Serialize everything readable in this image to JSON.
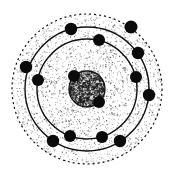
{
  "figure": {
    "caption": "",
    "style": "vintage engraving / stippled line art",
    "colors": {
      "background": "#ffffff",
      "ink": "#111111",
      "stipple": "#2a2a2a",
      "nucleus_fill": "#888888"
    },
    "canvas": {
      "width": 175,
      "height": 178
    },
    "center": {
      "x": 87,
      "y": 89
    }
  },
  "nucleus": {
    "label": "nucleus",
    "cx": 87,
    "cy": 89,
    "r": 18,
    "texture": "dense-stipple",
    "outline": true,
    "blobs": [
      {
        "name": "nucleon-blob-upper-left",
        "cx": 74,
        "cy": 76,
        "r": 6
      },
      {
        "name": "nucleon-blob-lower-right",
        "cx": 99,
        "cy": 102,
        "r": 6
      }
    ]
  },
  "shells": [
    {
      "name": "inner-shell",
      "index": 1,
      "r": 50,
      "stroke": "solid",
      "stroke_width": 1.4,
      "electron_count": 5
    },
    {
      "name": "middle-shell",
      "index": 2,
      "r": 62,
      "stroke": "solid",
      "stroke_width": 1.4,
      "electron_count": 6
    },
    {
      "name": "outer-shell",
      "index": 3,
      "r": 75,
      "stroke": "dashed",
      "stroke_width": 1.2,
      "dash": "2 3",
      "electron_count": 1
    }
  ],
  "electrons": [
    {
      "id": 1,
      "shell": 1,
      "angle_deg": -76,
      "cx": 99,
      "cy": 40,
      "r": 6.0
    },
    {
      "id": 2,
      "shell": 1,
      "angle_deg": -14,
      "cx": 136,
      "cy": 77,
      "r": 6.0
    },
    {
      "id": 3,
      "shell": 1,
      "angle_deg": 72,
      "cx": 102,
      "cy": 137,
      "r": 6.0
    },
    {
      "id": 4,
      "shell": 1,
      "angle_deg": 110,
      "cx": 70,
      "cy": 136,
      "r": 6.0
    },
    {
      "id": 5,
      "shell": 1,
      "angle_deg": 190,
      "cx": 38,
      "cy": 80,
      "r": 6.0
    },
    {
      "id": 6,
      "shell": 2,
      "angle_deg": -105,
      "cx": 71,
      "cy": 29,
      "r": 6.2
    },
    {
      "id": 7,
      "shell": 2,
      "angle_deg": -35,
      "cx": 138,
      "cy": 53,
      "r": 6.2
    },
    {
      "id": 8,
      "shell": 2,
      "angle_deg": 6,
      "cx": 149,
      "cy": 95,
      "r": 6.2
    },
    {
      "id": 9,
      "shell": 2,
      "angle_deg": 58,
      "cx": 120,
      "cy": 141,
      "r": 6.2
    },
    {
      "id": 10,
      "shell": 2,
      "angle_deg": 123,
      "cx": 53,
      "cy": 141,
      "r": 6.2
    },
    {
      "id": 11,
      "shell": 2,
      "angle_deg": 168,
      "cx": 26,
      "cy": 67,
      "r": 6.2
    },
    {
      "id": 12,
      "shell": 3,
      "angle_deg": -55,
      "cx": 131,
      "cy": 27,
      "r": 6.5
    }
  ],
  "annotations": {
    "atom_label": "",
    "electron_label": "",
    "nucleus_label": ""
  }
}
